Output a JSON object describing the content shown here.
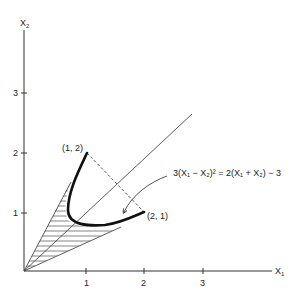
{
  "diagram": {
    "axes": {
      "x_label": "X",
      "x_label_sub": "1",
      "y_label": "X",
      "y_label_sub": "2",
      "x_ticks": [
        "1",
        "2",
        "3"
      ],
      "y_ticks": [
        "1",
        "2",
        "3"
      ]
    },
    "points": [
      {
        "label": "(1, 2)",
        "x": 1,
        "y": 2
      },
      {
        "label": "(2, 1)",
        "x": 2,
        "y": 1
      }
    ],
    "equation": {
      "text": "3(X₁ − X₂)² = 2(X₁ + X₂) − 3"
    },
    "elements": {
      "diagonal_line": "X1 = X2",
      "dashed_segment": "from (1,2) to (2,1)",
      "bold_curve": "parabola 3(X1-X2)^2 = 2(X1+X2) - 3 between (1,2) and (2,1)",
      "shaded_region": "cone from origin bounded by tangent rays and curve"
    }
  }
}
